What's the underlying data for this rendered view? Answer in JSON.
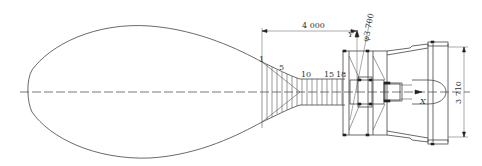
{
  "figure": {
    "type": "engineering-section-drawing",
    "dimensions": {
      "length_label": "4 000",
      "diameter_label": "φ3 700",
      "height_label": "3 710"
    },
    "station_labels": [
      "1",
      "5",
      "10",
      "15",
      "18"
    ],
    "axes": {
      "y_label": "Y",
      "x_label": "X"
    },
    "colors": {
      "line": "#444444",
      "background": "#ffffff"
    }
  }
}
